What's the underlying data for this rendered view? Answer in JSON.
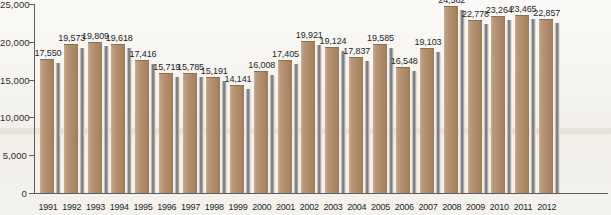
{
  "chart_data": {
    "type": "bar",
    "title": "",
    "subtitle": "",
    "xlabel": "",
    "ylabel": "",
    "categories": [
      "1991",
      "1992",
      "1993",
      "1994",
      "1995",
      "1996",
      "1997",
      "1998",
      "1999",
      "2000",
      "2001",
      "2002",
      "2003",
      "2004",
      "2005",
      "2006",
      "2007",
      "2008",
      "2009",
      "2010",
      "2011",
      "2012"
    ],
    "values": [
      17550,
      19573,
      19809,
      19618,
      17416,
      15719,
      15785,
      15191,
      14141,
      16008,
      17405,
      19921,
      19124,
      17837,
      19585,
      16548,
      19103,
      24582,
      22778,
      23264,
      23465,
      22857
    ],
    "value_labels": [
      "17,550",
      "19,573",
      "19,809",
      "19,618",
      "17,416",
      "15,719",
      "15,785",
      "15,191",
      "14,141",
      "16,008",
      "17,405",
      "19,921",
      "19,124",
      "17,837",
      "19,585",
      "16,548",
      "19,103",
      "24,582",
      "22,778",
      "23,264",
      "23,465",
      "22,857"
    ],
    "ylim": [
      0,
      25000
    ],
    "y_ticks": [
      0,
      5000,
      10000,
      15000,
      20000,
      25000
    ],
    "y_tick_labels": [
      "0",
      "5,000",
      "10,000",
      "15,000",
      "20,000",
      "25,000"
    ],
    "grid": false,
    "legend": null,
    "series": [
      {
        "name": "",
        "values": [
          17550,
          19573,
          19809,
          19618,
          17416,
          15719,
          15785,
          15191,
          14141,
          16008,
          17405,
          19921,
          19124,
          17837,
          19585,
          16548,
          19103,
          24582,
          22778,
          23264,
          23465,
          22857
        ]
      }
    ],
    "colors": {
      "bar_fill": "#b18d6d",
      "bar_shadow": "#6e6e6e",
      "background": "#f3f1ec",
      "axis": "#5d5d5d",
      "text": "#1f1f1f"
    }
  }
}
